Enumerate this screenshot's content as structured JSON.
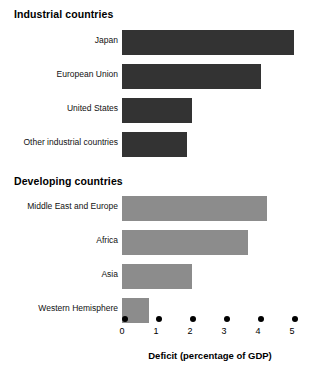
{
  "chart_data": {
    "type": "bar",
    "orientation": "horizontal",
    "title": "",
    "xlabel": "Deficit (percentage of GDP)",
    "ylabel": "",
    "xlim": [
      0,
      5
    ],
    "xticks": [
      "0",
      "1",
      "2",
      "3",
      "4",
      "5"
    ],
    "grid": false,
    "legend": "none",
    "groups": [
      {
        "name": "Industrial countries",
        "color": "#333333",
        "categories": [
          "Japan",
          "European Union",
          "United States",
          "Other industrial countries"
        ],
        "values": [
          5.05,
          4.1,
          2.05,
          1.9
        ]
      },
      {
        "name": "Developing countries",
        "color": "#8c8c8c",
        "categories": [
          "Middle East and Europe",
          "Africa",
          "Asia",
          "Western Hemisphere"
        ],
        "values": [
          4.25,
          3.7,
          2.05,
          0.8
        ]
      }
    ]
  },
  "headings": {
    "industrial": "Industrial countries",
    "developing": "Developing countries"
  },
  "axis": {
    "title": "Deficit (percentage of GDP)",
    "ticks": [
      "0",
      "1",
      "2",
      "3",
      "4",
      "5"
    ]
  },
  "bars": {
    "industrial": [
      {
        "label": "Japan",
        "value": 5.05
      },
      {
        "label": "European Union",
        "value": 4.1
      },
      {
        "label": "United States",
        "value": 2.05
      },
      {
        "label": "Other industrial countries",
        "value": 1.9
      }
    ],
    "developing": [
      {
        "label": "Middle East and Europe",
        "value": 4.25
      },
      {
        "label": "Africa",
        "value": 3.7
      },
      {
        "label": "Asia",
        "value": 2.05
      },
      {
        "label": "Western Hemisphere",
        "value": 0.8
      }
    ]
  },
  "colors": {
    "industrial_bar": "#333333",
    "developing_bar": "#8c8c8c",
    "text": "#000000",
    "background": "#ffffff"
  }
}
